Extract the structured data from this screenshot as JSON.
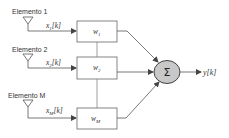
{
  "diagram": {
    "title": "",
    "colors": {
      "line": "#555555",
      "box_border": "#666666",
      "summer_fill": "#c8c8c8",
      "text": "#333333"
    },
    "elements": [
      {
        "label": "Elemento 1",
        "signal": "x",
        "signal_sub": "1",
        "signal_suffix": "[k]",
        "weight": "w",
        "weight_sub": "1"
      },
      {
        "label": "Elemento 2",
        "signal": "x",
        "signal_sub": "2",
        "signal_suffix": "[k]",
        "weight": "w",
        "weight_sub": "2"
      },
      {
        "label": "Elemento M",
        "signal": "x",
        "signal_sub": "M",
        "signal_suffix": "[k]",
        "weight": "w",
        "weight_sub": "M"
      }
    ],
    "summer": {
      "symbol": "Σ"
    },
    "output": {
      "label": "y[k]"
    }
  }
}
